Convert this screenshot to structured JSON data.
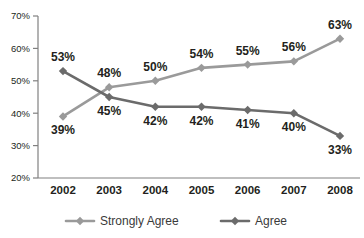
{
  "chart_data": {
    "type": "line",
    "title": "",
    "xlabel": "",
    "ylabel": "",
    "categories": [
      "2002",
      "2003",
      "2004",
      "2005",
      "2006",
      "2007",
      "2008"
    ],
    "ylim": [
      20,
      70
    ],
    "yticks": [
      "20%",
      "30%",
      "40%",
      "50%",
      "60%",
      "70%"
    ],
    "ytick_values": [
      20,
      30,
      40,
      50,
      60,
      70
    ],
    "grid": false,
    "legend_position": "bottom",
    "value_suffix": "%",
    "series": [
      {
        "name": "Strongly Agree",
        "color": "#9a9a9a",
        "marker": "diamond",
        "values": [
          39,
          48,
          50,
          54,
          55,
          56,
          63
        ],
        "labels": [
          "39%",
          "48%",
          "50%",
          "54%",
          "55%",
          "56%",
          "63%"
        ],
        "label_positions": [
          "below",
          "above",
          "above",
          "above",
          "above",
          "above",
          "above"
        ]
      },
      {
        "name": "Agree",
        "color": "#6b6b6b",
        "marker": "diamond",
        "values": [
          53,
          45,
          42,
          42,
          41,
          40,
          33
        ],
        "labels": [
          "53%",
          "45%",
          "42%",
          "42%",
          "41%",
          "40%",
          "33%"
        ],
        "label_positions": [
          "above",
          "below",
          "below",
          "below",
          "below",
          "below",
          "below"
        ]
      }
    ]
  },
  "legend": {
    "items": [
      {
        "label": "Strongly Agree",
        "color": "#9a9a9a"
      },
      {
        "label": "Agree",
        "color": "#6b6b6b"
      }
    ]
  },
  "axis": {
    "line_color": "#808080"
  }
}
